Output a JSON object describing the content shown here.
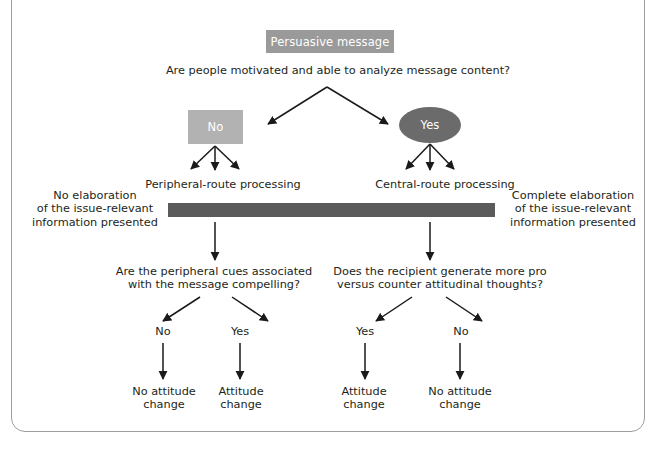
{
  "diagram": {
    "title_node": {
      "label": "Persuasive message",
      "fill": "#9a9a9a",
      "shape": "rectangle"
    },
    "top_question": "Are people motivated and able to analyze message content?",
    "branches": {
      "no_node": {
        "label": "No",
        "fill": "#b2b2b2",
        "shape": "rectangle"
      },
      "yes_node": {
        "label": "Yes",
        "fill": "#6b6b6b",
        "shape": "ellipse"
      }
    },
    "route_labels": {
      "left": "Peripheral-route processing",
      "right": "Central-route processing"
    },
    "continuum": {
      "fill": "#5b5b5b",
      "left_note": "No elaboration\nof the issue-relevant\ninformation presented",
      "right_note": "Complete elaboration\nof the issue-relevant\ninformation presented"
    },
    "second_questions": {
      "left": "Are the peripheral cues associated\nwith the message compelling?",
      "right": "Does the recipient generate more pro\nversus counter attitudinal thoughts?"
    },
    "answer_labels": {
      "left_no": "No",
      "left_yes": "Yes",
      "right_yes": "Yes",
      "right_no": "No"
    },
    "outcomes": {
      "left_no": "No attitude\nchange",
      "left_yes": "Attitude\nchange",
      "right_yes": "Attitude\nchange",
      "right_no": "No attitude\nchange"
    },
    "colors": {
      "text": "#231f20",
      "frame": "#9b9d9f",
      "arrow": "#1a1a1a"
    }
  }
}
